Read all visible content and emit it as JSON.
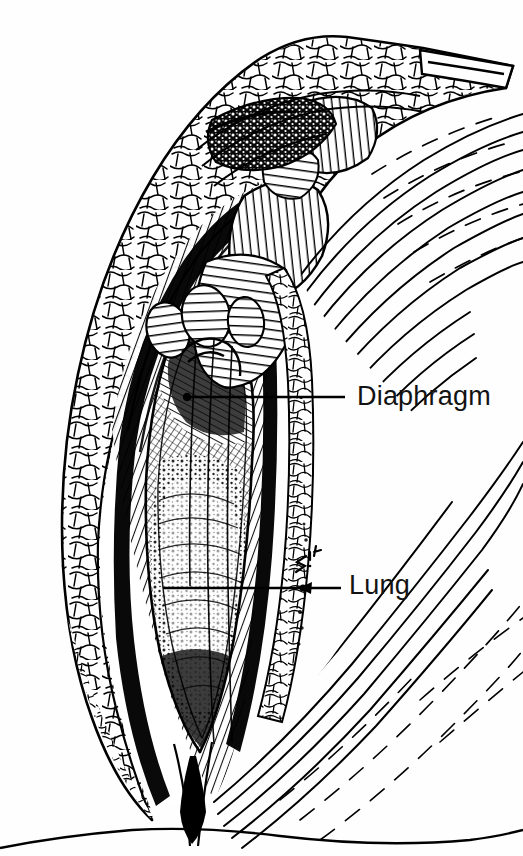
{
  "figure": {
    "kind": "anatomical-line-illustration",
    "technique": "pen-and-ink engraving",
    "background_color": "#fefefe",
    "ink_color": "#000000",
    "width": 523,
    "height": 856
  },
  "labels": [
    {
      "id": "diaphragm",
      "text": "Diaphragm",
      "text_x": 357,
      "text_y": 383,
      "leader": {
        "x1": 187,
        "y1": 397,
        "x2": 345,
        "y2": 397,
        "terminus": "dot"
      }
    },
    {
      "id": "lung",
      "text": "Lung",
      "text_x": 349,
      "text_y": 572,
      "leader": {
        "x1": 163,
        "y1": 588,
        "x2": 341,
        "y2": 588,
        "terminus": "arrowhead-left"
      }
    }
  ],
  "annotations": [
    {
      "id": "margin-scribble",
      "text": "z.Li",
      "x": 300,
      "y": 560
    }
  ],
  "structures": [
    {
      "name": "subcutaneous-fat",
      "texture": "lobular-cellular-outline"
    },
    {
      "name": "chest-wall-muscle",
      "texture": "dense-parallel-hatching"
    },
    {
      "name": "ribs",
      "texture": "banded-ribbed-ovals"
    },
    {
      "name": "pleural-cavity",
      "texture": "dark-stipple"
    },
    {
      "name": "lung-surface",
      "texture": "fine-cross-hatch"
    },
    {
      "name": "diaphragm",
      "texture": "directional-hatching"
    },
    {
      "name": "skin-flank",
      "texture": "radiating-flow-lines"
    }
  ]
}
